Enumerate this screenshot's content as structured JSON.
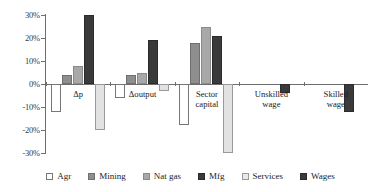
{
  "chart_data": {
    "type": "bar",
    "title": "",
    "xlabel": "",
    "ylabel": "",
    "ylim": [
      -30,
      30
    ],
    "ytick_labels": [
      "30%",
      "20%",
      "10%",
      "0%",
      "-10%",
      "-20%",
      "-30%"
    ],
    "ytick_values": [
      30,
      20,
      10,
      0,
      -10,
      -20,
      -30
    ],
    "grid": false,
    "legend_position": "bottom",
    "categories": [
      "Δp",
      "Δoutput",
      "Sector\ncapital",
      "Unskilled\nwage",
      "Skilled\nwage"
    ],
    "series": [
      {
        "name": "Agr",
        "color": "#ffffff",
        "values": [
          -12,
          -6,
          -18,
          null,
          null
        ]
      },
      {
        "name": "Mining",
        "color": "#8e8e8e",
        "values": [
          4,
          4,
          18,
          null,
          null
        ]
      },
      {
        "name": "Nat gas",
        "color": "#a8a8a8",
        "values": [
          8,
          5,
          25,
          null,
          null
        ]
      },
      {
        "name": "Mfg",
        "color": "#3a3a3a",
        "values": [
          30,
          19,
          21,
          null,
          null
        ]
      },
      {
        "name": "Services",
        "color": "#e2e2e2",
        "values": [
          -20,
          -3,
          -30,
          null,
          null
        ]
      },
      {
        "name": "Wages",
        "color": "#3a3a3a",
        "values": [
          null,
          null,
          null,
          -4,
          -12
        ]
      }
    ]
  },
  "legend": {
    "items": [
      {
        "label": "Agr"
      },
      {
        "label": "Mining"
      },
      {
        "label": "Nat gas"
      },
      {
        "label": "Mfg"
      },
      {
        "label": "Services"
      },
      {
        "label": "Wages"
      }
    ]
  }
}
